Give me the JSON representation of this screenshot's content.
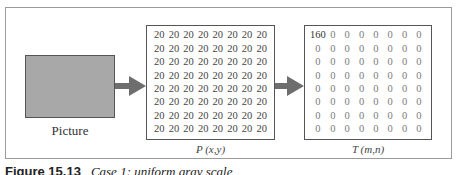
{
  "diagram": {
    "picture": {
      "label": "Picture",
      "fill_color": "#a8a8a8"
    },
    "matrix_p": {
      "label": "P (x,y)",
      "rows": [
        [
          "20",
          "20",
          "20",
          "20",
          "20",
          "20",
          "20",
          "20"
        ],
        [
          "20",
          "20",
          "20",
          "20",
          "20",
          "20",
          "20",
          "20"
        ],
        [
          "20",
          "20",
          "20",
          "20",
          "20",
          "20",
          "20",
          "20"
        ],
        [
          "20",
          "20",
          "20",
          "20",
          "20",
          "20",
          "20",
          "20"
        ],
        [
          "20",
          "20",
          "20",
          "20",
          "20",
          "20",
          "20",
          "20"
        ],
        [
          "20",
          "20",
          "20",
          "20",
          "20",
          "20",
          "20",
          "20"
        ],
        [
          "20",
          "20",
          "20",
          "20",
          "20",
          "20",
          "20",
          "20"
        ],
        [
          "20",
          "20",
          "20",
          "20",
          "20",
          "20",
          "20",
          "20"
        ]
      ]
    },
    "matrix_t": {
      "label": "T (m,n)",
      "rows": [
        [
          "160",
          "0",
          "0",
          "0",
          "0",
          "0",
          "0",
          "0"
        ],
        [
          "0",
          "0",
          "0",
          "0",
          "0",
          "0",
          "0",
          "0"
        ],
        [
          "0",
          "0",
          "0",
          "0",
          "0",
          "0",
          "0",
          "0"
        ],
        [
          "0",
          "0",
          "0",
          "0",
          "0",
          "0",
          "0",
          "0"
        ],
        [
          "0",
          "0",
          "0",
          "0",
          "0",
          "0",
          "0",
          "0"
        ],
        [
          "0",
          "0",
          "0",
          "0",
          "0",
          "0",
          "0",
          "0"
        ],
        [
          "0",
          "0",
          "0",
          "0",
          "0",
          "0",
          "0",
          "0"
        ],
        [
          "0",
          "0",
          "0",
          "0",
          "0",
          "0",
          "0",
          "0"
        ]
      ]
    },
    "arrows": [
      {
        "from": "picture",
        "to": "matrix_p",
        "color": "#6e6e6e"
      },
      {
        "from": "matrix_p",
        "to": "matrix_t",
        "color": "#6e6e6e"
      }
    ]
  },
  "caption": {
    "figure_number": "Figure 15.13",
    "text": "Case 1: uniform gray scale"
  }
}
